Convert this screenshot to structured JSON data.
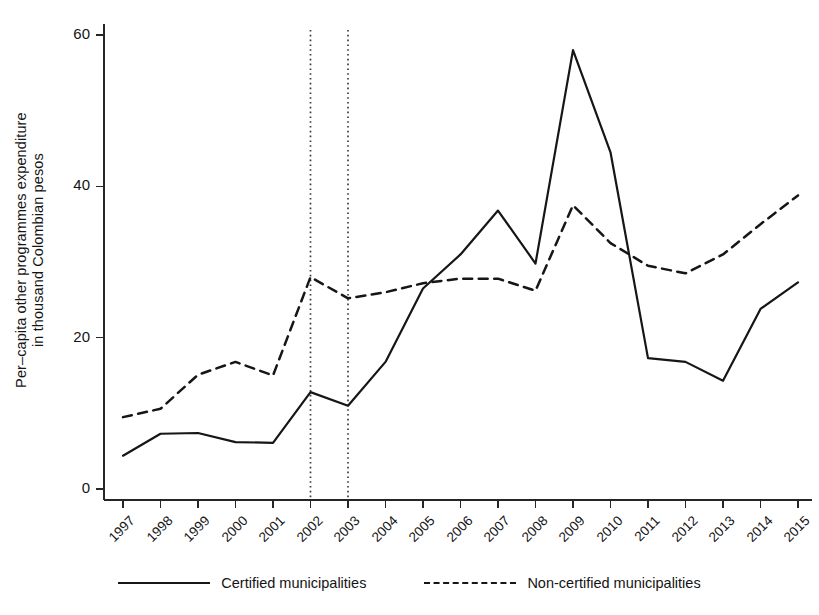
{
  "chart_data": {
    "type": "line",
    "title": "",
    "xlabel": "",
    "ylabel": "Per–capita other programmes expenditure in thousand Colombian pesos",
    "ylabel_lines": [
      "Per–capita other programmes expenditure",
      "in thousand Colombian pesos"
    ],
    "categories": [
      "1997",
      "1998",
      "1999",
      "2000",
      "2001",
      "2002",
      "2003",
      "2004",
      "2005",
      "2006",
      "2007",
      "2008",
      "2009",
      "2010",
      "2011",
      "2012",
      "2013",
      "2014",
      "2015"
    ],
    "x": [
      1997,
      1998,
      1999,
      2000,
      2001,
      2002,
      2003,
      2004,
      2005,
      2006,
      2007,
      2008,
      2009,
      2010,
      2011,
      2012,
      2013,
      2014,
      2015
    ],
    "series": [
      {
        "name": "Certified municipalities",
        "style": "solid",
        "color": "#161616",
        "values": [
          4.4,
          7.3,
          7.4,
          6.2,
          6.1,
          12.8,
          11.0,
          16.8,
          26.5,
          31.0,
          36.8,
          29.8,
          58.0,
          44.5,
          17.3,
          16.8,
          14.3,
          23.8,
          27.3
        ]
      },
      {
        "name": "Non-certified municipalities",
        "style": "dashed",
        "color": "#161616",
        "values": [
          9.5,
          10.6,
          15.1,
          16.8,
          15.0,
          28.0,
          25.2,
          26.0,
          27.2,
          27.8,
          27.8,
          26.2,
          37.5,
          32.5,
          29.5,
          28.5,
          31.0,
          35.0,
          38.8
        ]
      }
    ],
    "ylim": [
      0,
      62
    ],
    "yticks": [
      0,
      20,
      40,
      60
    ],
    "ytick_labels": [
      "0",
      "20",
      "40",
      "60"
    ],
    "grid": false,
    "legend_position": "bottom",
    "annotations": [
      {
        "type": "vline",
        "x": 2002,
        "style": "dotted",
        "label": ""
      },
      {
        "type": "vline",
        "x": 2003,
        "style": "dotted",
        "label": ""
      }
    ]
  },
  "legend": {
    "items": [
      {
        "label": "Certified municipalities",
        "style": "solid"
      },
      {
        "label": "Non-certified municipalities",
        "style": "dashed"
      }
    ]
  },
  "axis": {
    "y_title_line1": "Per–capita other programmes expenditure",
    "y_title_line2": "in thousand Colombian pesos"
  }
}
